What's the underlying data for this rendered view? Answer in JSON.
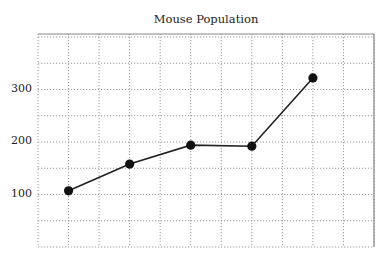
{
  "chart_data": {
    "type": "line",
    "title": "Mouse Population",
    "xlabel": "",
    "ylabel": "",
    "categories": [
      "1",
      "2",
      "3",
      "4",
      "5"
    ],
    "series": [
      {
        "name": "Mouse Population",
        "values": [
          107,
          158,
          194,
          192,
          322
        ]
      }
    ],
    "yticks": [
      100,
      200,
      300
    ],
    "ytick_labels": [
      "100",
      "200",
      "300"
    ],
    "ylim": [
      0,
      406
    ],
    "grid": true,
    "grid_style": "dotted",
    "legend": null,
    "colors": {
      "line": "#222222",
      "marker": "#111111",
      "grid": "#999999",
      "border": "#888888"
    }
  }
}
